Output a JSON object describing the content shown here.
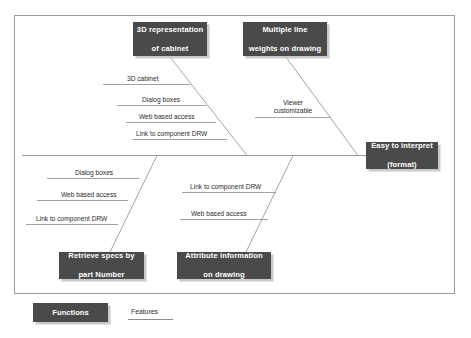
{
  "diagram": {
    "type": "fishbone",
    "effect": {
      "label": "Easy to interpret\n(format)",
      "line1": "Easy to interpret",
      "line2": "(format)"
    },
    "categories": [
      {
        "id": "3d-representation-of-cabinet",
        "line1": "3D representation",
        "line2": "of cabinet",
        "position": "top-left",
        "features": [
          "3D cabinet",
          "Dialog boxes",
          "Web based access",
          "Link to component DRW"
        ]
      },
      {
        "id": "multiple-line-weights-on-drawing",
        "line1": "Multiple line",
        "line2": "weights on drawing",
        "position": "top-right",
        "features": [
          "Viewer customizable"
        ]
      },
      {
        "id": "retrieve-specs-by-part-number",
        "line1": "Retrieve specs by",
        "line2": "part Number",
        "position": "bottom-left",
        "features": [
          "Dialog boxes",
          "Web based access",
          "Link to component DRW"
        ]
      },
      {
        "id": "attribute-information-on-drawing",
        "line1": "Attribute information",
        "line2": "on drawing",
        "position": "bottom-right",
        "features": [
          "Link to component DRW",
          "Web based access"
        ]
      }
    ],
    "feature_labels": {
      "tl1": "3D cabinet",
      "tl2": "Dialog boxes",
      "tl3": "Web based access",
      "tl4": "Link to component DRW",
      "tr1_line1": "Viewer",
      "tr1_line2": "customizable",
      "bl1": "Dialog boxes",
      "bl2": "Web based access",
      "bl3": "Link to component DRW",
      "bm1": "Link to component DRW",
      "bm2": "Web based access"
    }
  },
  "legend": {
    "functions_label": "Functions",
    "features_label": "Features"
  },
  "colors": {
    "box_fill": "#4a4a4a",
    "box_text": "#ffffff",
    "line": "#8c8c8c",
    "shadow": "#c9c9c9",
    "frame": "#9a9a9a",
    "background": "#ffffff"
  }
}
